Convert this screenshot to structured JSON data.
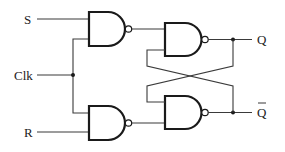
{
  "diagram": {
    "inputs": {
      "s_label": "S",
      "clk_label": "Clk",
      "r_label": "R"
    },
    "outputs": {
      "q_label": "Q",
      "qbar_label": "Q"
    },
    "gates": [
      {
        "id": "nand-s",
        "type": "NAND",
        "inputs": [
          "S",
          "Clk"
        ]
      },
      {
        "id": "nand-r",
        "type": "NAND",
        "inputs": [
          "Clk",
          "R"
        ]
      },
      {
        "id": "nand-q",
        "type": "NAND",
        "inputs": [
          "nand-s",
          "nand-qbar"
        ]
      },
      {
        "id": "nand-qbar",
        "type": "NAND",
        "inputs": [
          "nand-q",
          "nand-r"
        ]
      }
    ],
    "colors": {
      "line": "#1a1a1a",
      "background": "#ffffff"
    }
  }
}
